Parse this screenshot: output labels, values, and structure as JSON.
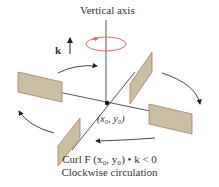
{
  "figure": {
    "axis_label": "Vertical axis",
    "unit_vector_label": "k",
    "point_label": "(x₀, y₀)",
    "caption_line1": "Curl F (x₀, y₀) • k < 0",
    "caption_line2": "Clockwise circulation"
  },
  "colors": {
    "paddle_fill": "#c9bfa3",
    "paddle_edge": "#b07a5e",
    "rotation_ring": "#e0705a",
    "lines": "#333333",
    "text": "#333333"
  },
  "elements": {
    "paddles": 4,
    "circulation_arrows": 4,
    "rotation_direction": "clockwise"
  }
}
